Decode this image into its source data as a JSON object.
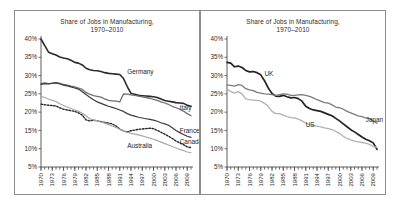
{
  "chart_data": [
    {
      "type": "line",
      "panel": "left",
      "title": "Share of Jobs in Manufacturing,\n1970–2010",
      "xlabel": "",
      "ylabel": "",
      "ylim": [
        5,
        40
      ],
      "ytick_labels": [
        "40%",
        "35%",
        "30%",
        "25%",
        "20%",
        "15%",
        "10%",
        "5%"
      ],
      "ytick_values": [
        40,
        35,
        30,
        25,
        20,
        15,
        10,
        5
      ],
      "xlim": [
        1970,
        2010
      ],
      "xtick_labels": [
        "1970",
        "1973",
        "1976",
        "1979",
        "1982",
        "1985",
        "1988",
        "1991",
        "1994",
        "1997",
        "2000",
        "2003",
        "2006",
        "2009"
      ],
      "xtick_values": [
        1970,
        1973,
        1976,
        1979,
        1982,
        1985,
        1988,
        1991,
        1994,
        1997,
        2000,
        2003,
        2006,
        2009
      ],
      "grid": false,
      "legend_position": "inline-end-labels",
      "x": [
        1970,
        1971,
        1972,
        1973,
        1974,
        1975,
        1976,
        1977,
        1978,
        1979,
        1980,
        1981,
        1982,
        1983,
        1984,
        1985,
        1986,
        1987,
        1988,
        1989,
        1990,
        1991,
        1992,
        1993,
        1994,
        1995,
        1996,
        1997,
        1998,
        1999,
        2000,
        2001,
        2002,
        2003,
        2004,
        2005,
        2006,
        2007,
        2008,
        2009,
        2010
      ],
      "series": [
        {
          "name": "Germany",
          "color": "#2a2a2a",
          "style": "solid",
          "width": 1.6,
          "label_x": 1993,
          "label_y": 30.5,
          "values": [
            40.0,
            38.2,
            36.4,
            36.0,
            35.6,
            35.1,
            34.8,
            34.6,
            34.2,
            33.6,
            33.4,
            32.9,
            32.0,
            31.6,
            31.4,
            31.3,
            31.1,
            30.8,
            30.6,
            30.5,
            30.4,
            30.3,
            29.2,
            27.0,
            25.1,
            24.9,
            24.6,
            24.5,
            24.4,
            24.3,
            24.2,
            24.0,
            23.6,
            23.2,
            23.0,
            22.8,
            22.6,
            22.5,
            22.4,
            21.9,
            21.6
          ]
        },
        {
          "name": "Italy",
          "color": "#6f6f6f",
          "style": "solid",
          "width": 1.3,
          "label_x": 2007,
          "label_y": 20.5,
          "values": [
            27.8,
            28.0,
            27.8,
            27.9,
            28.1,
            27.9,
            27.6,
            27.4,
            27.1,
            26.9,
            26.6,
            26.2,
            25.4,
            24.9,
            24.5,
            24.3,
            24.1,
            23.6,
            23.2,
            23.1,
            23.0,
            22.8,
            25.0,
            24.9,
            24.7,
            24.6,
            24.4,
            24.2,
            24.0,
            23.8,
            23.5,
            23.2,
            22.8,
            22.5,
            22.1,
            21.6,
            21.2,
            20.8,
            20.3,
            19.6,
            19.0
          ]
        },
        {
          "name": "France",
          "color": "#3a3a3a",
          "style": "solid",
          "width": 1.2,
          "label_x": 2007,
          "label_y": 14.2,
          "values": [
            27.6,
            27.8,
            27.7,
            27.9,
            28.0,
            27.7,
            27.4,
            27.2,
            26.9,
            26.6,
            26.3,
            25.6,
            24.8,
            24.1,
            23.4,
            22.8,
            22.4,
            22.0,
            21.6,
            21.3,
            21.0,
            20.6,
            20.2,
            19.6,
            19.2,
            18.9,
            18.6,
            18.4,
            18.2,
            18.0,
            17.8,
            17.5,
            17.1,
            16.8,
            16.4,
            15.7,
            15.0,
            14.4,
            13.9,
            13.4,
            13.1
          ]
        },
        {
          "name": "Canada",
          "color": "#232323",
          "style": "dotted",
          "width": 1.4,
          "label_x": 2007,
          "label_y": 11.2,
          "values": [
            22.2,
            22.0,
            21.9,
            21.8,
            21.7,
            21.2,
            20.8,
            20.6,
            20.4,
            20.2,
            19.8,
            19.2,
            17.9,
            17.6,
            17.8,
            17.6,
            17.4,
            17.2,
            17.0,
            16.8,
            16.2,
            15.4,
            14.8,
            14.6,
            14.9,
            15.1,
            15.3,
            15.4,
            15.5,
            15.6,
            15.5,
            15.0,
            14.5,
            14.0,
            13.4,
            12.8,
            12.1,
            11.6,
            11.1,
            10.5,
            10.3
          ]
        },
        {
          "name": "Australia",
          "color": "#a8a8a8",
          "style": "solid",
          "width": 1.2,
          "label_x": 1993,
          "label_y": 10.3,
          "values": [
            24.3,
            24.0,
            23.6,
            23.2,
            22.9,
            22.3,
            21.8,
            21.4,
            21.0,
            20.6,
            20.2,
            19.7,
            19.0,
            18.2,
            17.9,
            17.6,
            17.3,
            17.0,
            16.6,
            16.2,
            15.8,
            15.3,
            14.8,
            14.5,
            14.2,
            14.0,
            13.8,
            13.5,
            13.2,
            12.9,
            12.6,
            12.2,
            11.8,
            11.4,
            11.0,
            10.6,
            10.2,
            9.8,
            9.5,
            9.1,
            8.9
          ]
        }
      ]
    },
    {
      "type": "line",
      "panel": "right",
      "title": "Share of Jobs in Manufacturing,\n1970–2010",
      "xlabel": "",
      "ylabel": "",
      "ylim": [
        5,
        40
      ],
      "ytick_labels": [
        "40%",
        "35%",
        "30%",
        "25%",
        "20%",
        "15%",
        "10%",
        "5%"
      ],
      "ytick_values": [
        40,
        35,
        30,
        25,
        20,
        15,
        10,
        5
      ],
      "xlim": [
        1970,
        2010
      ],
      "xtick_labels": [
        "1970",
        "1973",
        "1976",
        "1979",
        "1982",
        "1985",
        "1988",
        "1991",
        "1994",
        "1997",
        "2000",
        "2003",
        "2006",
        "2009"
      ],
      "xtick_values": [
        1970,
        1973,
        1976,
        1979,
        1982,
        1985,
        1988,
        1991,
        1994,
        1997,
        2000,
        2003,
        2006,
        2009
      ],
      "grid": false,
      "legend_position": "inline-end-labels",
      "x": [
        1970,
        1971,
        1972,
        1973,
        1974,
        1975,
        1976,
        1977,
        1978,
        1979,
        1980,
        1981,
        1982,
        1983,
        1984,
        1985,
        1986,
        1987,
        1988,
        1989,
        1990,
        1991,
        1992,
        1993,
        1994,
        1995,
        1996,
        1997,
        1998,
        1999,
        2000,
        2001,
        2002,
        2003,
        2004,
        2005,
        2006,
        2007,
        2008,
        2009,
        2010
      ],
      "series": [
        {
          "name": "UK",
          "color": "#232323",
          "style": "solid",
          "width": 1.7,
          "label_x": 1980,
          "label_y": 30.0,
          "values": [
            33.6,
            33.4,
            32.4,
            32.6,
            32.2,
            31.4,
            31.0,
            31.1,
            30.8,
            30.2,
            28.6,
            26.6,
            25.1,
            24.4,
            24.3,
            24.6,
            24.2,
            23.9,
            24.0,
            23.7,
            23.0,
            21.6,
            21.0,
            20.6,
            20.4,
            20.2,
            19.8,
            19.4,
            19.0,
            18.3,
            17.6,
            16.8,
            16.0,
            15.2,
            14.6,
            13.9,
            13.2,
            12.6,
            12.2,
            11.6,
            9.8
          ]
        },
        {
          "name": "Japan",
          "color": "#7b7b7b",
          "style": "solid",
          "width": 1.3,
          "label_x": 2007,
          "label_y": 17.4,
          "values": [
            27.4,
            27.3,
            27.1,
            27.5,
            27.3,
            26.4,
            26.1,
            25.9,
            25.4,
            25.2,
            25.0,
            24.9,
            24.8,
            24.6,
            24.8,
            25.0,
            24.9,
            24.6,
            24.6,
            24.7,
            24.8,
            24.6,
            24.3,
            23.9,
            23.4,
            23.0,
            22.6,
            22.5,
            22.0,
            21.4,
            21.2,
            20.8,
            20.2,
            19.8,
            19.4,
            19.0,
            18.8,
            18.4,
            18.2,
            17.6,
            17.0
          ]
        },
        {
          "name": "US",
          "color": "#b2b2b2",
          "style": "solid",
          "width": 1.3,
          "label_x": 1991,
          "label_y": 16.0,
          "values": [
            26.4,
            25.6,
            25.2,
            25.6,
            25.0,
            23.6,
            23.4,
            23.3,
            23.2,
            23.0,
            22.4,
            21.6,
            20.2,
            19.6,
            19.6,
            19.2,
            18.8,
            18.5,
            18.4,
            18.1,
            17.6,
            17.0,
            16.6,
            16.4,
            16.2,
            16.0,
            15.7,
            15.5,
            15.2,
            14.7,
            14.2,
            13.4,
            12.8,
            12.4,
            12.1,
            11.9,
            11.7,
            11.5,
            11.2,
            10.6,
            10.4
          ]
        }
      ]
    }
  ]
}
